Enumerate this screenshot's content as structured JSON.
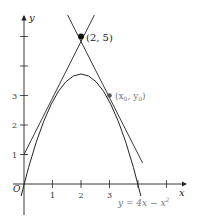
{
  "diagram": {
    "axes": {
      "x_label": "x",
      "y_label": "y",
      "origin_label": "O",
      "x_ticks": [
        "1",
        "2",
        "3"
      ],
      "y_ticks": [
        "1",
        "2",
        "3"
      ]
    },
    "curve": {
      "equation": "y = 4x − x²",
      "label_prefix": "y = 4x − x",
      "label_exp": "2"
    },
    "points": [
      {
        "name": "external-point",
        "label": "(2, 5)",
        "x": 2,
        "y": 5
      },
      {
        "name": "tangent-point",
        "label_main": "(x",
        "sub0": "0",
        "label_mid": ", y",
        "sub1": "0",
        "label_end": ")",
        "x": 3,
        "y": 3
      }
    ],
    "tangent_lines": [
      {
        "slope": 2,
        "intercept": 1,
        "tangent_at_x": 1
      },
      {
        "slope": -2,
        "intercept": 9,
        "tangent_at_x": 3
      }
    ],
    "colors": {
      "ink": "#222222",
      "label_gray": "#777777"
    }
  }
}
